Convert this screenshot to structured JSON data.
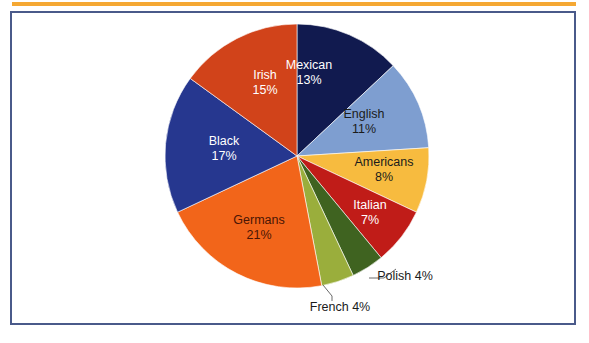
{
  "figure": {
    "frame_color": "#4a5a8a",
    "rule_color": "#f5a833",
    "background": "#ffffff"
  },
  "chart_data": {
    "type": "pie",
    "title": "",
    "subtitle": "",
    "xlabel": "",
    "ylabel": "",
    "legend": "none",
    "grid": false,
    "value_unit": "percent",
    "start_angle_deg": 0,
    "direction": "clockwise",
    "categories": [
      "Mexican",
      "English",
      "Americans",
      "Italian",
      "Polish",
      "French",
      "Germans",
      "Black",
      "Irish"
    ],
    "values": [
      13,
      11,
      8,
      7,
      4,
      4,
      21,
      17,
      15
    ],
    "colors": [
      "#111a4f",
      "#7e9ed0",
      "#f7bb3f",
      "#c01c18",
      "#3f6320",
      "#9aae3c",
      "#f2651a",
      "#26378f",
      "#d1431a"
    ],
    "slices": [
      {
        "label": "Mexican",
        "value_text": "13%",
        "value": 13,
        "color": "#111a4f",
        "text_color": "#ffffff",
        "label_placement": "inside"
      },
      {
        "label": "English",
        "value_text": "11%",
        "value": 11,
        "color": "#7e9ed0",
        "text_color": "#1b1b1b",
        "label_placement": "inside"
      },
      {
        "label": "Americans",
        "value_text": "8%",
        "value": 8,
        "color": "#f7bb3f",
        "text_color": "#1b1b1b",
        "label_placement": "inside"
      },
      {
        "label": "Italian",
        "value_text": "7%",
        "value": 7,
        "color": "#c01c18",
        "text_color": "#ffffff",
        "label_placement": "inside"
      },
      {
        "label": "Polish",
        "value_text": "4%",
        "value": 4,
        "color": "#3f6320",
        "text_color": "#1b1b1b",
        "label_placement": "outside-callout"
      },
      {
        "label": "French",
        "value_text": "4%",
        "value": 4,
        "color": "#9aae3c",
        "text_color": "#1b1b1b",
        "label_placement": "outside-callout"
      },
      {
        "label": "Germans",
        "value_text": "21%",
        "value": 21,
        "color": "#f2651a",
        "text_color": "#4a1505",
        "label_placement": "inside"
      },
      {
        "label": "Black",
        "value_text": "17%",
        "value": 17,
        "color": "#26378f",
        "text_color": "#ffffff",
        "label_placement": "inside"
      },
      {
        "label": "Irish",
        "value_text": "15%",
        "value": 15,
        "color": "#d1431a",
        "text_color": "#ffffff",
        "label_placement": "inside"
      }
    ],
    "total": 100
  }
}
